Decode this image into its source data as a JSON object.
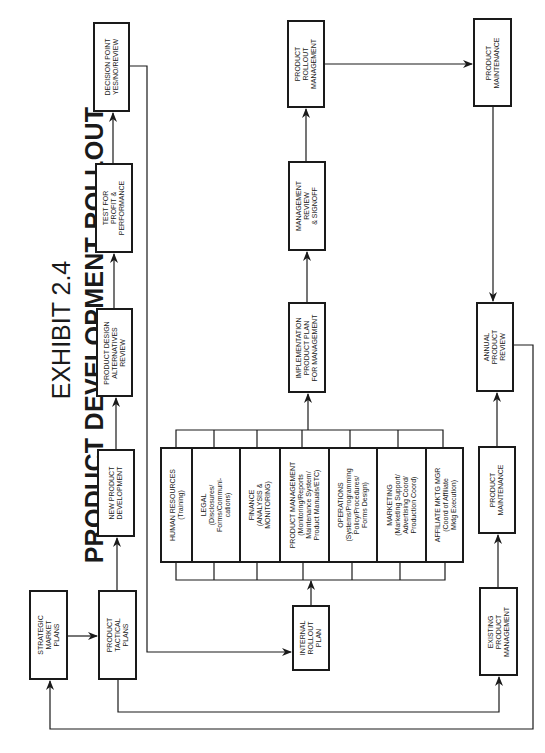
{
  "title": {
    "line1": "EXHIBIT 2.4",
    "line2": "PRODUCT DEVELOPMENT ROLLOUT"
  },
  "nodes": {
    "strategic_market_plans": "STRATEGIC\nMARKET\nPLANS",
    "product_tactical_plans": "PRODUCT\nTACTICAL\nPLANS",
    "new_product_development": "NEW PRODUCT\nDEVELOPMENT",
    "product_design_review": "PRODUCT DESIGN\nALTERNATIVES\nREVIEW",
    "test_profit_performance": "TEST FOR\nPROFIT &\nPERFORMANCE",
    "decision_point": "DECISION POINT\nYES/NO/REVIEW",
    "internal_rollout_plan": "INTERNAL\nROLLOUT\nPLAN",
    "implementation_plan": "IMPLEMENTATION\nPRODUCT PLAN\nFOR MANAGEMENT",
    "management_review": "MANAGEMENT\nREVIEW\n& SIGNOFF",
    "product_rollout_management": "PRODUCT\nROLLOUT\nMANAGEMENT",
    "product_maintenance_top": "PRODUCT\nMAINTENANCE",
    "annual_product_review": "ANNUAL\nPRODUCT\nREVIEW",
    "product_maintenance_bottom": "PRODUCT\nMAINTENANCE",
    "existing_product_management": "EXISTING\nPRODUCT\nMANAGEMENT"
  },
  "departments": [
    {
      "label": "HUMAN RESOURCES\n(Training)"
    },
    {
      "label": "LEGAL\n(Disclosures/\nForms/Communi-\ncations)"
    },
    {
      "label": "FINANCE\n(ANALYSIS &\nMONITORING)"
    },
    {
      "label": "PRODUCT MANAGEMENT\n(Monitoring/Reports\nMaintenance System/\nProduct Manuals/ETC)"
    },
    {
      "label": "OPERATIONS\n(Systems/Programming\nPolicy/Procedures/\nForms Design)"
    },
    {
      "label": "MARKETING\n(Marketing Support/\nAdvertising Coord/\nProduction Coord)"
    },
    {
      "label": "AFFILIATE MKTG MGR\n(Coord of Affiliate\nMktg Execution)"
    }
  ],
  "colors": {
    "ink": "#1a1a1a",
    "background": "#ffffff"
  }
}
